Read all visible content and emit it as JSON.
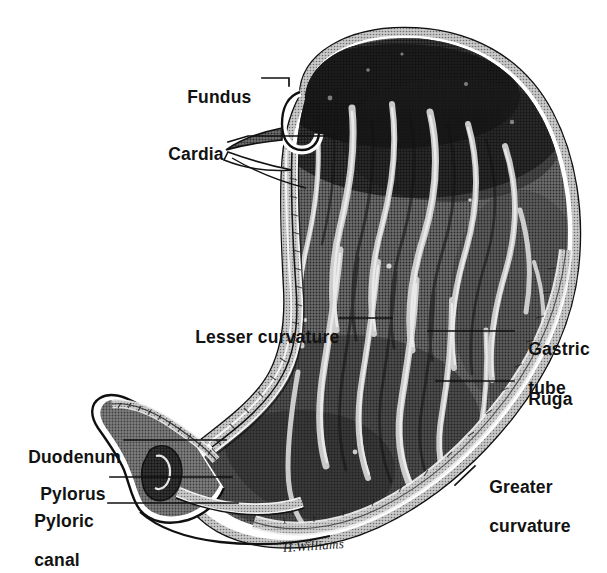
{
  "figure": {
    "style": "halftone engraving",
    "background_color": "#ffffff",
    "ink_color": "#121212",
    "signature": "H.Williams"
  },
  "labels": [
    {
      "id": "fundus",
      "text": "Fundus",
      "lines": [
        "Fundus"
      ],
      "x": 177,
      "y": 70,
      "align": "left"
    },
    {
      "id": "cardia",
      "text": "Cardia",
      "lines": [
        "Cardia"
      ],
      "x": 158,
      "y": 127,
      "align": "left"
    },
    {
      "id": "lesser-curvature",
      "text": "Lesser curvature",
      "lines": [
        "Lesser curvature"
      ],
      "x": 185,
      "y": 310,
      "align": "left"
    },
    {
      "id": "gastric-tube",
      "text": "Gastric tube",
      "lines": [
        "Gastric",
        "tube"
      ],
      "x": 518,
      "y": 319,
      "align": "left"
    },
    {
      "id": "ruga",
      "text": "Ruga",
      "lines": [
        "Ruga"
      ],
      "x": 518,
      "y": 371,
      "align": "left"
    },
    {
      "id": "duodenum",
      "text": "Duodenum",
      "lines": [
        "Duodenum"
      ],
      "x": 18,
      "y": 430,
      "align": "left"
    },
    {
      "id": "pylorus",
      "text": "Pylorus",
      "lines": [
        "Pylorus"
      ],
      "x": 30,
      "y": 466,
      "align": "left"
    },
    {
      "id": "pyloric-canal",
      "text": "Pyloric canal",
      "lines": [
        "Pyloric",
        "canal"
      ],
      "x": 24,
      "y": 494,
      "align": "left"
    },
    {
      "id": "greater-curvature",
      "text": "Greater curvature",
      "lines": [
        "Greater",
        "curvature"
      ],
      "x": 479,
      "y": 459,
      "align": "left"
    }
  ],
  "leaders": [
    {
      "id": "leader-fundus",
      "for": "fundus",
      "points": "262,78 289,78 289,86"
    },
    {
      "id": "leader-cardia",
      "for": "cardia",
      "points": "228,142 248,136 326,136"
    },
    {
      "id": "leader-lesser-curvature",
      "for": "lesser-curvature",
      "points": "339,318 392,318"
    },
    {
      "id": "leader-gastric-tube",
      "for": "gastric-tube",
      "points": "428,331 514,331"
    },
    {
      "id": "leader-ruga",
      "for": "ruga",
      "points": "436,381 514,381"
    },
    {
      "id": "leader-duodenum",
      "for": "duodenum",
      "points": "124,440 226,440"
    },
    {
      "id": "leader-pylorus",
      "for": "pylorus",
      "points": "110,477 232,477"
    },
    {
      "id": "leader-pyloric-canal",
      "for": "pyloric-canal",
      "points": "108,503 238,503"
    },
    {
      "id": "leader-greater-curvature",
      "for": "greater-curvature",
      "points": "455,485 475,466"
    }
  ],
  "anatomy": {
    "regions": [
      {
        "id": "fundus-dome",
        "name": "Fundus",
        "description": "upper dome of the stomach, darkest shading"
      },
      {
        "id": "cardia-notch",
        "name": "Cardia",
        "description": "J-shaped hook at oesophageal opening"
      },
      {
        "id": "body",
        "name": "Body",
        "description": "central mass of longitudinal rugae"
      },
      {
        "id": "lesser-curve",
        "name": "Lesser curvature",
        "description": "concave right-hand border, smooth mucosa"
      },
      {
        "id": "greater-curve",
        "name": "Greater curvature",
        "description": "convex outer border with muscular wall"
      },
      {
        "id": "gastric-tube-reg",
        "name": "Gastric tube",
        "description": "narrow channel along lesser curvature"
      },
      {
        "id": "antrum",
        "name": "Pyloric antrum",
        "description": "lower funnel leading to pylorus"
      },
      {
        "id": "pylorus-reg",
        "name": "Pylorus",
        "description": "muscular sphincter ring"
      },
      {
        "id": "duodenum-reg",
        "name": "Duodenum",
        "description": "first portion of small intestine, left"
      }
    ]
  }
}
